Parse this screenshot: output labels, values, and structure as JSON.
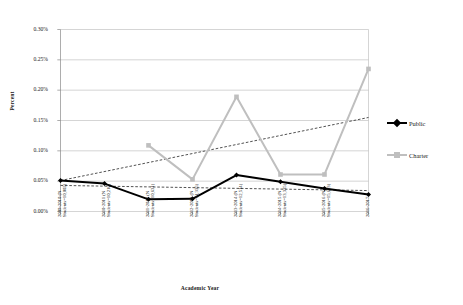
{
  "chart_data": {
    "type": "line",
    "title": "",
    "xlabel": "Academic Year",
    "ylabel": "Percent",
    "ylim": [
      0.0,
      0.3
    ],
    "ytick_labels": [
      "0.30%",
      "0.25%",
      "0.20%",
      "0.15%",
      "0.10%",
      "0.05%",
      "0.00%"
    ],
    "ytick_values": [
      0.3,
      0.25,
      0.2,
      0.15,
      0.1,
      0.05,
      0.0
    ],
    "grid": "horizontal",
    "legend_position": "right",
    "categories": [
      "2009-2010 (N Students=10,002)",
      "2010-2011 (N Students=10,216)",
      "2011-2012 (N Students=10,631)",
      "2012-2013 (N Students=11,335)",
      "2013-2014 (N Students=12,514)",
      "2014-2015 (N Students=13,335)",
      "2015-2016 (N Students=15,693)",
      "2016-2017"
    ],
    "category_lines": [
      [
        "2009-2010 (N",
        "Students=10,002)"
      ],
      [
        "2010-2011 (N",
        "Students=10,216)"
      ],
      [
        "2011-2012 (N",
        "Students=10,631)"
      ],
      [
        "2012-2013 (N",
        "Students=11,335)"
      ],
      [
        "2013-2014 (N",
        "Students=12,514)"
      ],
      [
        "2014-2015 (N",
        "Students=13,335)"
      ],
      [
        "2015-2016 (N",
        "Students=15,693)"
      ],
      [
        "2016-2017",
        ""
      ]
    ],
    "series": [
      {
        "name": "Public",
        "color": "#000000",
        "marker": "diamond",
        "values": [
          0.051,
          0.046,
          0.02,
          0.021,
          0.06,
          0.049,
          0.038,
          0.028
        ]
      },
      {
        "name": "Charter",
        "color": "#bfbfbf",
        "marker": "square",
        "values": [
          null,
          null,
          0.109,
          0.053,
          0.189,
          0.061,
          0.061,
          0.235
        ]
      }
    ],
    "trendlines": [
      {
        "name": "charter-trendline",
        "for_series": "Charter",
        "style": "dashed",
        "color": "#333333",
        "start": {
          "x_index": 0,
          "y": 0.051
        },
        "end": {
          "x_index": 7,
          "y": 0.155
        }
      },
      {
        "name": "public-trendline",
        "for_series": "Public",
        "style": "dashed",
        "color": "#333333",
        "start": {
          "x_index": 0,
          "y": 0.043
        },
        "end": {
          "x_index": 7,
          "y": 0.0345
        }
      }
    ]
  },
  "legend": {
    "items": [
      {
        "label": "Public",
        "color": "#000000",
        "marker": "diamond"
      },
      {
        "label": "Charter",
        "color": "#bfbfbf",
        "marker": "square"
      }
    ]
  },
  "axes": {
    "y_title": "Percent",
    "x_title": "Academic Year"
  }
}
